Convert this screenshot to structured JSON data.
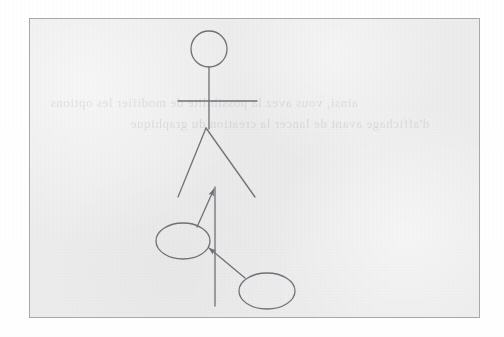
{
  "page": {
    "background_color": "#ffffff"
  },
  "frame": {
    "fill_color": "#ececec",
    "border_color": "#a8a8a8",
    "x": 29,
    "y": 18,
    "width": 451,
    "height": 300
  },
  "bleed_through": {
    "note": "faint mirrored show-through text from reverse side of the page, illegible",
    "line_1": "ainsi, vous avez la possibilite de modifier les options",
    "line_2": "d'affichage avant de lancer la creation du graphique"
  },
  "drawing": {
    "stroke_color": "#6f7176",
    "stroke_width": 1.3,
    "stick_figure": {
      "head": {
        "cx": 179,
        "cy": 30,
        "r": 18
      },
      "spine": {
        "x1": 179,
        "y1": 48,
        "x2": 179,
        "y2": 109
      },
      "arms": {
        "x1": 148,
        "y1": 82,
        "x2": 227,
        "y2": 82
      },
      "leg_left": {
        "x1": 176,
        "y1": 109,
        "x2": 148,
        "y2": 178
      },
      "leg_right": {
        "x1": 176,
        "y1": 109,
        "x2": 225,
        "y2": 178
      }
    },
    "sketch": {
      "vertical_line": {
        "x1": 185,
        "y1": 168,
        "x2": 185,
        "y2": 287
      },
      "ellipse_left": {
        "cx": 153,
        "cy": 222,
        "rx": 27,
        "ry": 18
      },
      "ellipse_right": {
        "cx": 237,
        "cy": 272,
        "rx": 28,
        "ry": 18
      },
      "connector_up": {
        "x1": 167,
        "y1": 208,
        "x2": 185,
        "y2": 168,
        "arrow_at": "end"
      },
      "connector_down": {
        "x1": 178,
        "y1": 229,
        "x2": 215,
        "y2": 259,
        "arrow_at": "start"
      }
    }
  }
}
